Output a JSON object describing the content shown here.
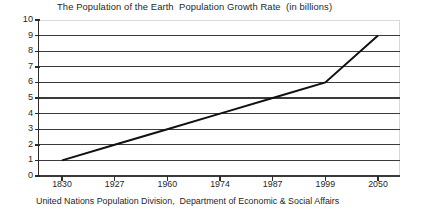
{
  "chart_data": {
    "type": "line",
    "title": "The Population of the Earth  Population Growth Rate  (in billions)",
    "footer": "United Nations Population Division,  Department of Economic & Social Affairs",
    "xlabel": "",
    "ylabel": "",
    "grid": true,
    "legend": "none",
    "categories": [
      "1830",
      "1927",
      "1960",
      "1974",
      "1987",
      "1999",
      "2050"
    ],
    "x": [
      1830,
      1927,
      1960,
      1974,
      1987,
      1999,
      2050
    ],
    "values": [
      1,
      2,
      3,
      4,
      5,
      6,
      9
    ],
    "series": [
      {
        "name": "World population (billions)",
        "values": [
          1,
          2,
          3,
          4,
          5,
          6,
          9
        ]
      }
    ],
    "ylim": [
      0,
      10
    ],
    "y_ticks": [
      "10",
      "9",
      "8",
      "7",
      "6",
      "5",
      "4",
      "3",
      "2",
      "1",
      "0"
    ],
    "line_color": "#111111",
    "grid_color": "#3a3a3a",
    "axis_color": "#2b2b2b",
    "background_color": "#ffffff"
  }
}
